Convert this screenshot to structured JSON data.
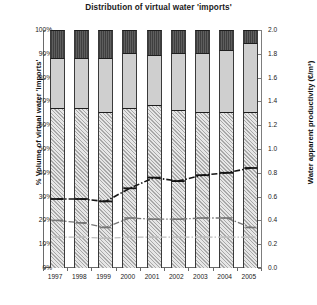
{
  "chart_data": {
    "type": "bar",
    "title": "Distribution of virtual water 'imports'",
    "xlabel": "",
    "ylabel": "% Volume of virtual water 'imports'",
    "ylabel_right": "Water apparent productivity (€/m³)",
    "categories": [
      "1997",
      "1998",
      "1999",
      "2000",
      "2001",
      "2002",
      "2003",
      "2004",
      "2005"
    ],
    "ylim": [
      0,
      100
    ],
    "ylim_right": [
      0.0,
      2.0
    ],
    "yticks": [
      "0%",
      "10%",
      "20%",
      "30%",
      "40%",
      "50%",
      "60%",
      "70%",
      "80%",
      "90%",
      "100%"
    ],
    "yticks_right": [
      "0.0",
      "0.2",
      "0.4",
      "0.6",
      "0.8",
      "1.0",
      "1.2",
      "1.4",
      "1.6",
      "1.8",
      "2.0"
    ],
    "grid": false,
    "legend": "none",
    "stacked": true,
    "series": [
      {
        "name": "bottom-segment",
        "style": "hatched",
        "values": [
          67,
          67,
          65,
          67,
          68,
          66,
          65,
          65,
          65
        ]
      },
      {
        "name": "middle-segment",
        "style": "light-gray",
        "values": [
          21,
          21,
          23,
          23,
          21,
          24,
          25,
          26,
          29
        ]
      },
      {
        "name": "top-segment",
        "style": "dark-striped",
        "values": [
          12,
          12,
          12,
          10,
          11,
          10,
          10,
          9,
          6
        ]
      }
    ],
    "line_series": [
      {
        "name": "productivity-high",
        "style": "dark-dashdot",
        "axis": "right",
        "values": [
          0.58,
          0.58,
          0.56,
          0.67,
          0.76,
          0.73,
          0.78,
          0.8,
          0.84
        ]
      },
      {
        "name": "productivity-mid",
        "style": "gray-dashdot",
        "axis": "right",
        "values": [
          0.4,
          0.38,
          0.34,
          0.42,
          0.41,
          0.41,
          0.42,
          0.42,
          0.34
        ]
      },
      {
        "name": "productivity-low",
        "style": "lightgray-dashdot",
        "axis": "right",
        "values": [
          0.26,
          0.26,
          0.25,
          0.26,
          0.26,
          0.26,
          0.26,
          0.26,
          0.26
        ]
      }
    ]
  },
  "colors": {
    "top_segment": "#4a4a4a",
    "middle_segment": "#cfcfcf",
    "bottom_segment": "#c4c4c4",
    "line_dark": "#1c1c1c",
    "line_mid": "#6e6e6e",
    "line_light": "#b4b4b4",
    "axis": "#6a6a6a",
    "text": "#1a1a1a"
  }
}
